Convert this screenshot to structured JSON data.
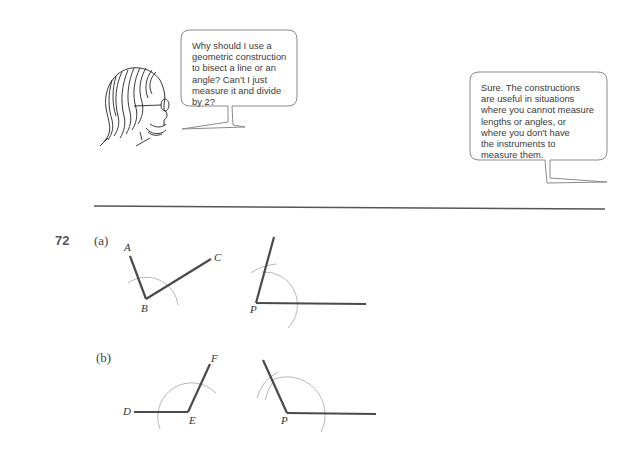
{
  "dialogue": {
    "question": "Why should I use a\ngeometric construction\nto bisect a line or an\nangle? Can’t I just\nmeasure it and divide\nby 2?",
    "answer": "Sure. The constructions\nare useful in situations\nwhere you cannot measure\nlengths or angles, or\nwhere you don't have\nthe instruments to\nmeasure them."
  },
  "problem": {
    "number": "72",
    "parts": [
      {
        "label": "(a)",
        "given_angle": {
          "points": [
            "A",
            "B",
            "C"
          ],
          "vertex": "B"
        },
        "copy_vertex": "P"
      },
      {
        "label": "(b)",
        "given_angle": {
          "points": [
            "D",
            "E",
            "F"
          ],
          "vertex": "E"
        },
        "copy_vertex": "P"
      }
    ]
  },
  "colors": {
    "line": "#4a4a4a",
    "arc": "#b8b8b8",
    "bubble_border": "#8a8a8a",
    "rule": "#555555"
  }
}
